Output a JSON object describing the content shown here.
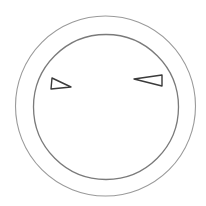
{
  "drawing": {
    "subject": "face",
    "background": "#ffffff",
    "stroke_colors": {
      "outer_circle": "#9a9a9a",
      "inner_circle": "#7a7a7a",
      "eyes": "#3a3a3a"
    },
    "outer_circle": {
      "cx": 105.5,
      "cy": 106,
      "r": 90
    },
    "inner_circle": {
      "cx": 106,
      "cy": 107,
      "r": 72.5
    },
    "left_eye": {
      "shape": "triangle",
      "points": "52,78 71,87 51,89"
    },
    "right_eye": {
      "shape": "triangle",
      "points": "134,79 162,75 162,86"
    }
  }
}
